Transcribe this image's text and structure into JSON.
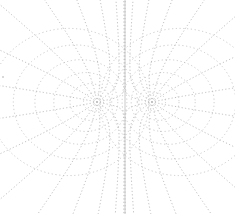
{
  "diagram": {
    "title": "",
    "line_color": "#b8b8b8",
    "background": "#ffffff",
    "poles": [
      {
        "label": "",
        "x": 97,
        "y": 102
      },
      {
        "label": "",
        "x": 152,
        "y": 102
      }
    ],
    "axis_x": 125,
    "left_marker": {
      "x": 3,
      "y": 77
    }
  }
}
